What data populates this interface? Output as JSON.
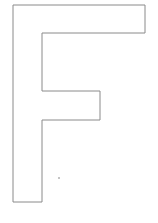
{
  "figure": {
    "letter": "F",
    "stroke_color": "#8a8a8a",
    "fill_color": "#ffffff",
    "background": "#ffffff",
    "outline_points": "13,5 145,5 145,33 42,33 42,91 100,91 100,120 42,120 42,202 13,202",
    "speck": {
      "cx": 59,
      "cy": 178,
      "r": 1,
      "color": "#b0b0b0"
    }
  }
}
